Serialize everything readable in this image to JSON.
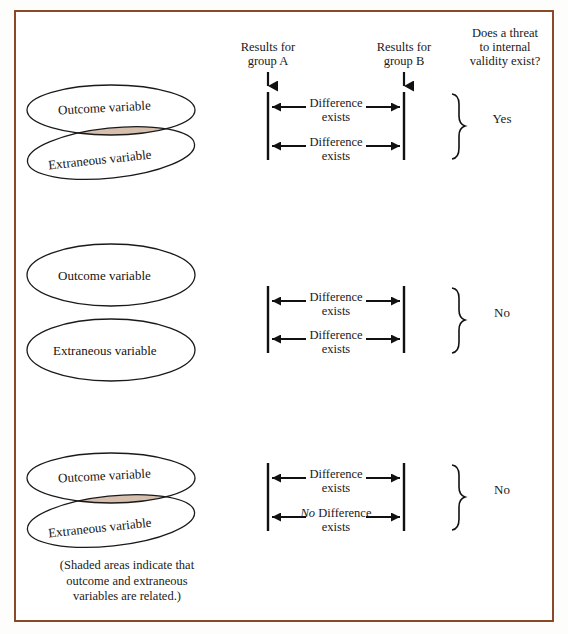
{
  "figure": {
    "border_color": "#8a4a28",
    "background": "#ffffff",
    "shade_color": "#d7bfae",
    "outline_color": "#1a1a1a"
  },
  "headers": {
    "group_a": "Results for\ngroup A",
    "group_b": "Results for\ngroup B",
    "threat": "Does a threat\nto internal\nvalidity exist?"
  },
  "rows": [
    {
      "id": "row-1",
      "ellipses_overlap": true,
      "shaded": true,
      "outcome_label": "Outcome variable",
      "extraneous_label": "Extraneous variable",
      "comparisons": [
        {
          "prefix": "",
          "text": "Difference\nexists"
        },
        {
          "prefix": "",
          "text": "Difference\nexists"
        }
      ],
      "answer": "Yes"
    },
    {
      "id": "row-2",
      "ellipses_overlap": false,
      "shaded": false,
      "outcome_label": "Outcome variable",
      "extraneous_label": "Extraneous variable",
      "comparisons": [
        {
          "prefix": "",
          "text": "Difference\nexists"
        },
        {
          "prefix": "",
          "text": "Difference\nexists"
        }
      ],
      "answer": "No"
    },
    {
      "id": "row-3",
      "ellipses_overlap": true,
      "shaded": true,
      "outcome_label": "Outcome variable",
      "extraneous_label": "Extraneous variable",
      "comparisons": [
        {
          "prefix": "",
          "text": "Difference\nexists"
        },
        {
          "prefix": "No",
          "text": " Difference\nexists"
        }
      ],
      "answer": "No"
    }
  ],
  "caption": "(Shaded areas indicate that\noutcome and extraneous\nvariables are related.)"
}
